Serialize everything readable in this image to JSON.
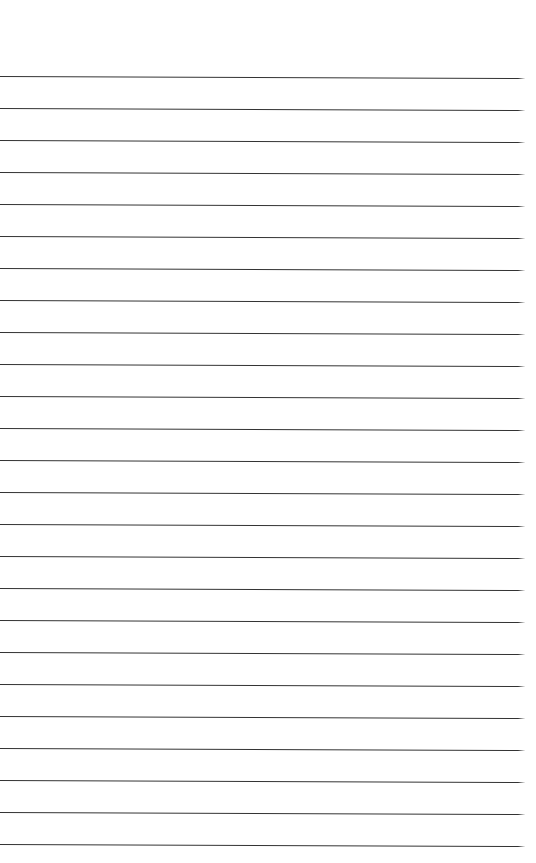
{
  "page": {
    "kind": "lined-paper-scan",
    "width_px": 536,
    "height_px": 863,
    "background_color": "#ffffff",
    "body_text": "",
    "has_text_content": false,
    "has_header": false,
    "has_footer": false,
    "has_margin_rule": false,
    "page_number_text": ""
  },
  "ruling": {
    "line_color": "#333333",
    "line_color_light": "#5a5a5a",
    "line_thickness_px": 1.2,
    "line_spacing_px": 32,
    "first_line_y_px": 76,
    "last_line_y_px": 844,
    "line_count": 25,
    "line_start_x_px": 0,
    "line_end_x_px": 528,
    "right_margin_px": 8,
    "slant_px_over_width": 2,
    "top_blank_area_px": 76
  },
  "lines": [
    {
      "index": 1,
      "y": 76,
      "x_start": 0,
      "x_end": 528,
      "slant": 2,
      "color": "#333333",
      "thickness": 1.2
    },
    {
      "index": 2,
      "y": 108,
      "x_start": 0,
      "x_end": 528,
      "slant": 2,
      "color": "#333333",
      "thickness": 1.2
    },
    {
      "index": 3,
      "y": 140,
      "x_start": 0,
      "x_end": 528,
      "slant": 2,
      "color": "#333333",
      "thickness": 1.2
    },
    {
      "index": 4,
      "y": 172,
      "x_start": 0,
      "x_end": 528,
      "slant": 2,
      "color": "#333333",
      "thickness": 1.2
    },
    {
      "index": 5,
      "y": 204,
      "x_start": 0,
      "x_end": 528,
      "slant": 2,
      "color": "#333333",
      "thickness": 1.2
    },
    {
      "index": 6,
      "y": 236,
      "x_start": 0,
      "x_end": 528,
      "slant": 2,
      "color": "#333333",
      "thickness": 1.2
    },
    {
      "index": 7,
      "y": 268,
      "x_start": 0,
      "x_end": 528,
      "slant": 2,
      "color": "#333333",
      "thickness": 1.2
    },
    {
      "index": 8,
      "y": 300,
      "x_start": 0,
      "x_end": 528,
      "slant": 2,
      "color": "#333333",
      "thickness": 1.2
    },
    {
      "index": 9,
      "y": 332,
      "x_start": 0,
      "x_end": 528,
      "slant": 2,
      "color": "#333333",
      "thickness": 1.2
    },
    {
      "index": 10,
      "y": 364,
      "x_start": 0,
      "x_end": 528,
      "slant": 2,
      "color": "#333333",
      "thickness": 1.2
    },
    {
      "index": 11,
      "y": 396,
      "x_start": 0,
      "x_end": 528,
      "slant": 2,
      "color": "#333333",
      "thickness": 1.2
    },
    {
      "index": 12,
      "y": 428,
      "x_start": 0,
      "x_end": 528,
      "slant": 2,
      "color": "#333333",
      "thickness": 1.2
    },
    {
      "index": 13,
      "y": 460,
      "x_start": 0,
      "x_end": 528,
      "slant": 2,
      "color": "#333333",
      "thickness": 1.2
    },
    {
      "index": 14,
      "y": 492,
      "x_start": 0,
      "x_end": 528,
      "slant": 2,
      "color": "#333333",
      "thickness": 1.2
    },
    {
      "index": 15,
      "y": 524,
      "x_start": 0,
      "x_end": 528,
      "slant": 2,
      "color": "#333333",
      "thickness": 1.2
    },
    {
      "index": 16,
      "y": 556,
      "x_start": 0,
      "x_end": 528,
      "slant": 2,
      "color": "#333333",
      "thickness": 1.2
    },
    {
      "index": 17,
      "y": 588,
      "x_start": 0,
      "x_end": 528,
      "slant": 2,
      "color": "#333333",
      "thickness": 1.2
    },
    {
      "index": 18,
      "y": 620,
      "x_start": 0,
      "x_end": 528,
      "slant": 2,
      "color": "#333333",
      "thickness": 1.2
    },
    {
      "index": 19,
      "y": 652,
      "x_start": 0,
      "x_end": 528,
      "slant": 2,
      "color": "#333333",
      "thickness": 1.2
    },
    {
      "index": 20,
      "y": 684,
      "x_start": 0,
      "x_end": 528,
      "slant": 2,
      "color": "#333333",
      "thickness": 1.2
    },
    {
      "index": 21,
      "y": 716,
      "x_start": 0,
      "x_end": 528,
      "slant": 2,
      "color": "#333333",
      "thickness": 1.2
    },
    {
      "index": 22,
      "y": 748,
      "x_start": 0,
      "x_end": 528,
      "slant": 2,
      "color": "#333333",
      "thickness": 1.2
    },
    {
      "index": 23,
      "y": 780,
      "x_start": 0,
      "x_end": 528,
      "slant": 2,
      "color": "#333333",
      "thickness": 1.2
    },
    {
      "index": 24,
      "y": 812,
      "x_start": 0,
      "x_end": 528,
      "slant": 2,
      "color": "#333333",
      "thickness": 1.2
    },
    {
      "index": 25,
      "y": 844,
      "x_start": 0,
      "x_end": 528,
      "slant": 2,
      "color": "#333333",
      "thickness": 1.2
    }
  ]
}
